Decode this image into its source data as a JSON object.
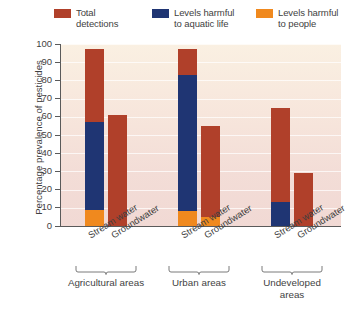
{
  "chart_data": {
    "type": "bar",
    "title": "",
    "subtitle": "",
    "xlabel": "",
    "ylabel": "Percentage prevalence of pesticides",
    "ylim": [
      0,
      100
    ],
    "yticks": [
      0,
      10,
      20,
      30,
      40,
      50,
      60,
      70,
      80,
      90,
      100
    ],
    "grid": true,
    "legend_position": "top",
    "stacked": true,
    "note": "Each bar is a stacked column: orange (levels harmful to people) at bottom, navy (levels harmful to aquatic life) above it, red-brown (total detections) filling to the top of the bar.",
    "groups": [
      {
        "name": "Agricultural areas",
        "categories": [
          "Stream water",
          "Groundwater"
        ]
      },
      {
        "name": "Urban areas",
        "categories": [
          "Stream water",
          "Groundwater"
        ]
      },
      {
        "name": "Undeveloped areas",
        "categories": [
          "Stream water",
          "Groundwater"
        ]
      }
    ],
    "categories": [
      "Agricultural areas - Stream water",
      "Agricultural areas - Groundwater",
      "Urban areas - Stream water",
      "Urban areas - Groundwater",
      "Undeveloped areas - Stream water",
      "Undeveloped areas - Groundwater"
    ],
    "series": [
      {
        "name": "Total detections",
        "color": "#b0402a",
        "values": [
          97,
          61,
          97,
          55,
          65,
          29
        ]
      },
      {
        "name": "Levels harmful to aquatic life",
        "color": "#1f3573",
        "values": [
          57,
          0,
          83,
          0,
          13,
          0
        ]
      },
      {
        "name": "Levels harmful to people",
        "color": "#f0891e",
        "values": [
          9,
          0,
          8,
          5,
          0,
          0
        ]
      }
    ]
  },
  "legend": {
    "items": [
      {
        "label": "Total\ndetections",
        "color": "#b0402a",
        "swatch_name": "legend-swatch-total-detections"
      },
      {
        "label": "Levels harmful\nto aquatic life",
        "color": "#1f3573",
        "swatch_name": "legend-swatch-aquatic-life"
      },
      {
        "label": "Levels harmful\nto people",
        "color": "#f0891e",
        "swatch_name": "legend-swatch-people"
      }
    ]
  },
  "axes": {
    "y_title": "Percentage prevalence of pesticides",
    "y_tick_labels": [
      "100",
      "90",
      "80",
      "70",
      "60",
      "50",
      "40",
      "30",
      "20",
      "10",
      "0"
    ]
  },
  "x_labels": [
    "Stream water",
    "Groundwater",
    "Stream water",
    "Groundwater",
    "Stream water",
    "Groundwater"
  ],
  "group_labels": [
    "Agricultural areas",
    "Urban areas",
    "Undeveloped\nareas"
  ],
  "colors": {
    "total_detections": "#b0402a",
    "aquatic_life": "#1f3573",
    "people": "#f0891e",
    "plot_bg_top": "#faf0e2",
    "plot_bg_bottom": "#f1d9d4",
    "axis": "#5a5a5a",
    "text": "#3f3f3f"
  }
}
